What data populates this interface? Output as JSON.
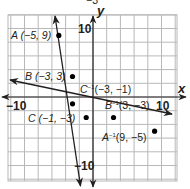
{
  "chart_data": {
    "type": "line",
    "title": "",
    "xlabel": "x",
    "ylabel": "y",
    "xlim": [
      -12,
      12
    ],
    "ylim": [
      -12,
      12
    ],
    "grid": true,
    "grid_step": 2,
    "tick_labels": {
      "x": [
        "−10",
        "10"
      ],
      "y": [
        "10",
        "−10"
      ]
    },
    "cut_off_top_label": "−3",
    "series": [
      {
        "name": "original line",
        "equation_slope": -3,
        "points": [
          {
            "label": "A",
            "x": -5,
            "y": 9,
            "text": "A (−5, 9)"
          },
          {
            "label": "B",
            "x": -3,
            "y": 3,
            "text": "B (−3, 3)"
          },
          {
            "label": "C",
            "x": -1,
            "y": -3,
            "text": "C (−1, −3)"
          }
        ]
      },
      {
        "name": "inverse line",
        "equation_slope": -0.3333,
        "points": [
          {
            "label": "C⁻¹",
            "x": -3,
            "y": -1,
            "text": "C⁻¹(−3, −1)"
          },
          {
            "label": "B⁻¹",
            "x": 3,
            "y": -3,
            "text": "B⁻¹(3, −3)"
          },
          {
            "label": "A⁻¹",
            "x": 9,
            "y": -5,
            "text": "A⁻¹(9, −5)"
          }
        ]
      }
    ]
  },
  "labels": {
    "top_cut": "−3",
    "x_axis": "x",
    "y_axis": "y",
    "tick_x_neg": "−10",
    "tick_x_pos": "10",
    "tick_y_pos": "10",
    "tick_y_neg": "−10",
    "A": "A (−5, 9)",
    "B": "B (−3, 3)",
    "C": "C (−1, −3)",
    "A_inv_letter": "A",
    "A_inv_sup": "−1",
    "A_inv_coords": "(9, −5)",
    "B_inv_letter": "B",
    "B_inv_sup": "−1",
    "B_inv_coords": "(3, −3)",
    "C_inv_letter": "C",
    "C_inv_sup": "−1",
    "C_inv_coords": "(−3, −1)"
  },
  "colors": {
    "grid": "#b8b8b8",
    "axis": "#231f20",
    "line": "#231f20",
    "point": "#000000"
  }
}
